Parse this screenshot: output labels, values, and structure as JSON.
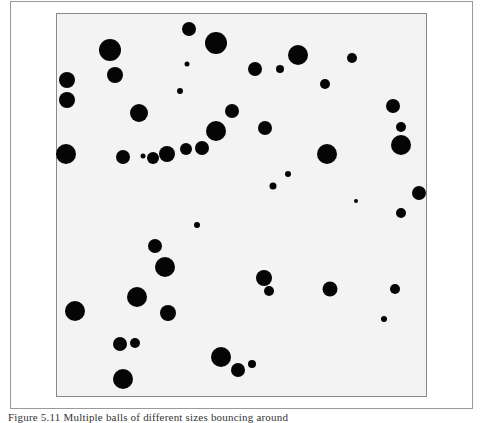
{
  "figure": {
    "caption": "Figure 5.11 Multiple balls of different sizes bouncing around",
    "colors": {
      "page_background": "#ffffff",
      "panel_background": "#f3f3f3",
      "panel_border": "#8a8a8a",
      "frame_border": "#9a9a9a",
      "ball_fill": "#050505"
    },
    "panel": {
      "x": 56,
      "y": 13,
      "width": 371,
      "height": 384
    },
    "balls": [
      {
        "x": 189,
        "y": 29,
        "r": 7
      },
      {
        "x": 216,
        "y": 43,
        "r": 11
      },
      {
        "x": 110,
        "y": 50,
        "r": 11
      },
      {
        "x": 187,
        "y": 64,
        "r": 2.5
      },
      {
        "x": 115,
        "y": 75,
        "r": 8
      },
      {
        "x": 67,
        "y": 80,
        "r": 8
      },
      {
        "x": 180,
        "y": 91,
        "r": 3
      },
      {
        "x": 67,
        "y": 100,
        "r": 8
      },
      {
        "x": 139,
        "y": 113,
        "r": 9
      },
      {
        "x": 232,
        "y": 111,
        "r": 7
      },
      {
        "x": 216,
        "y": 131,
        "r": 10
      },
      {
        "x": 202,
        "y": 148,
        "r": 7
      },
      {
        "x": 186,
        "y": 149,
        "r": 6
      },
      {
        "x": 167,
        "y": 154,
        "r": 8
      },
      {
        "x": 153,
        "y": 158,
        "r": 6
      },
      {
        "x": 143,
        "y": 156,
        "r": 2.5
      },
      {
        "x": 123,
        "y": 157,
        "r": 7
      },
      {
        "x": 66,
        "y": 154,
        "r": 10
      },
      {
        "x": 298,
        "y": 55,
        "r": 10
      },
      {
        "x": 255,
        "y": 69,
        "r": 7
      },
      {
        "x": 280,
        "y": 69,
        "r": 4
      },
      {
        "x": 352,
        "y": 58,
        "r": 5
      },
      {
        "x": 325,
        "y": 84,
        "r": 5
      },
      {
        "x": 393,
        "y": 106,
        "r": 7
      },
      {
        "x": 265,
        "y": 128,
        "r": 7
      },
      {
        "x": 401,
        "y": 127,
        "r": 5
      },
      {
        "x": 401,
        "y": 145,
        "r": 10
      },
      {
        "x": 327,
        "y": 154,
        "r": 10
      },
      {
        "x": 288,
        "y": 174,
        "r": 3
      },
      {
        "x": 273,
        "y": 186,
        "r": 3.5
      },
      {
        "x": 356,
        "y": 201,
        "r": 2
      },
      {
        "x": 419,
        "y": 193,
        "r": 7
      },
      {
        "x": 401,
        "y": 213,
        "r": 5
      },
      {
        "x": 197,
        "y": 225,
        "r": 3
      },
      {
        "x": 155,
        "y": 246,
        "r": 7
      },
      {
        "x": 165,
        "y": 267,
        "r": 10
      },
      {
        "x": 264,
        "y": 278,
        "r": 8
      },
      {
        "x": 269,
        "y": 291,
        "r": 5
      },
      {
        "x": 330,
        "y": 289,
        "r": 7.5
      },
      {
        "x": 395,
        "y": 289,
        "r": 5
      },
      {
        "x": 384,
        "y": 319,
        "r": 3
      },
      {
        "x": 75,
        "y": 311,
        "r": 10
      },
      {
        "x": 137,
        "y": 297,
        "r": 10
      },
      {
        "x": 168,
        "y": 313,
        "r": 8
      },
      {
        "x": 120,
        "y": 344,
        "r": 7
      },
      {
        "x": 135,
        "y": 343,
        "r": 5
      },
      {
        "x": 123,
        "y": 379,
        "r": 10
      },
      {
        "x": 221,
        "y": 357,
        "r": 10
      },
      {
        "x": 238,
        "y": 370,
        "r": 7
      },
      {
        "x": 252,
        "y": 364,
        "r": 4
      }
    ]
  }
}
